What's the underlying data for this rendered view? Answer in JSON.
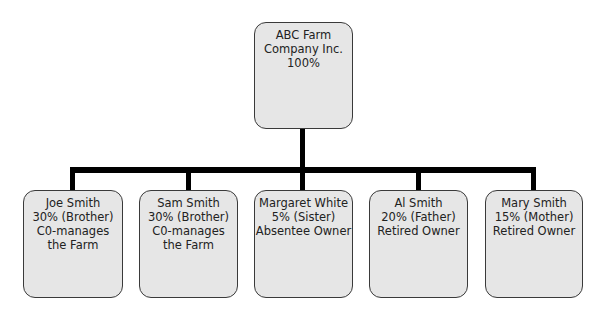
{
  "root": {
    "lines": [
      "ABC Farm",
      "Company Inc.",
      "100%"
    ]
  },
  "owners": [
    {
      "lines": [
        "Joe Smith",
        "30% (Brother)",
        "C0-manages",
        "the Farm"
      ]
    },
    {
      "lines": [
        "Sam Smith",
        "30% (Brother)",
        "C0-manages",
        "the Farm"
      ]
    },
    {
      "lines": [
        "Margaret White",
        "5% (Sister)",
        "Absentee Owner",
        ""
      ]
    },
    {
      "lines": [
        "Al Smith",
        "20% (Father)",
        "Retired Owner",
        ""
      ]
    },
    {
      "lines": [
        "Mary Smith",
        "15% (Mother)",
        "Retired Owner",
        ""
      ]
    }
  ],
  "colors": {
    "box_fill": "#e6e6e6",
    "box_border": "#3a3a3a",
    "connector": "#000000"
  }
}
